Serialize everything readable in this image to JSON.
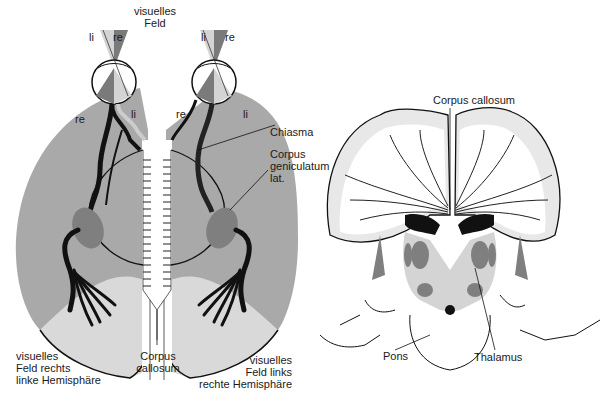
{
  "colors": {
    "hemisphere_gray": "#a9a9a9",
    "light_gray": "#d9d9d9",
    "nucleus_gray": "#7f7f7f",
    "dark_gray": "#6e6e6e",
    "black": "#111111",
    "white": "#ffffff"
  },
  "left_diagram": {
    "top_label": [
      "visuelles",
      "Feld"
    ],
    "left_eye": {
      "field_left": "li",
      "field_right": "re",
      "retina_left": "re",
      "retina_right": "li"
    },
    "right_eye": {
      "field_left": "li",
      "field_right": "re",
      "retina_left": "re",
      "retina_right": "li"
    },
    "chiasma": "Chiasma",
    "lgn": [
      "Corpus",
      "geniculatum",
      "lat."
    ],
    "corpus_callosum": [
      "Corpus",
      "callosum"
    ],
    "bottom_left": [
      "visuelles",
      "Feld rechts",
      "linke Hemisphäre"
    ],
    "bottom_right": [
      "visuelles",
      "Feld links",
      "rechte Hemisphäre"
    ]
  },
  "right_diagram": {
    "corpus_callosum": "Corpus callosum",
    "pons": "Pons",
    "thalamus": "Thalamus"
  }
}
